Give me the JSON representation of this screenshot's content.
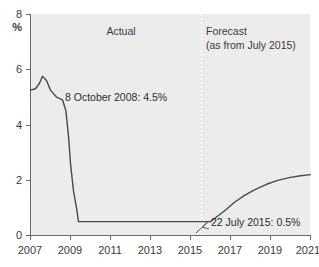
{
  "chart_data": {
    "type": "line",
    "title": "",
    "subtitle": "",
    "xlabel": "",
    "ylabel": "%",
    "ylim": [
      0,
      8
    ],
    "xlim": [
      2007,
      2021
    ],
    "grid": false,
    "legend_position": "none",
    "y_ticks": [
      "8",
      "6",
      "4",
      "2",
      "0"
    ],
    "y_tick_values": [
      8,
      6,
      4,
      2,
      0
    ],
    "x_ticks": [
      "2007",
      "2009",
      "2011",
      "2013",
      "2015",
      "2017",
      "2019",
      "2021"
    ],
    "x_tick_values": [
      2007,
      2009,
      2011,
      2013,
      2015,
      2017,
      2019,
      2021
    ],
    "series": [
      {
        "name": "Actual",
        "style": "solid",
        "x": [
          2007.0,
          2007.25,
          2007.45,
          2007.6,
          2007.8,
          2008.0,
          2008.3,
          2008.6,
          2008.77,
          2008.9,
          2009.0,
          2009.15,
          2009.3,
          2009.4,
          2010.0,
          2012.0,
          2014.0,
          2015.55,
          2016.0
        ],
        "y": [
          5.25,
          5.3,
          5.5,
          5.75,
          5.6,
          5.25,
          5.0,
          4.9,
          4.5,
          3.6,
          2.6,
          1.6,
          1.0,
          0.5,
          0.5,
          0.5,
          0.5,
          0.5,
          0.5
        ]
      },
      {
        "name": "Forecast",
        "style": "solid",
        "x": [
          2016.0,
          2016.4,
          2016.8,
          2017.2,
          2017.7,
          2018.2,
          2018.8,
          2019.4,
          2020.0,
          2020.5,
          2021.0
        ],
        "y": [
          0.5,
          0.72,
          0.95,
          1.2,
          1.45,
          1.65,
          1.85,
          2.0,
          2.1,
          2.16,
          2.2
        ]
      }
    ],
    "annotations": [
      {
        "id": "actual-region",
        "text": "Actual",
        "x": 2007.0,
        "y": 7.0
      },
      {
        "id": "forecast-region",
        "line1": "Forecast",
        "line2": "(as from July 2015)",
        "x": 2015.8,
        "y": 7.0
      },
      {
        "id": "point-oct-2008",
        "text": "8 October 2008: 4.5%",
        "value": 4.5,
        "date": "8 October 2008"
      },
      {
        "id": "point-jul-2015",
        "text": "22 July 2015: 0.5%",
        "value": 0.5,
        "date": "22 July 2015"
      }
    ],
    "divider": {
      "label": "forecast-start",
      "x": 2015.55
    },
    "colors": {
      "plot_background": "#ececed",
      "line": "#4a4a4a",
      "axis": "#6b6b6b",
      "text": "#3a3a3a",
      "divider": "#fcfcfc",
      "page_background": "#ffffff"
    }
  }
}
